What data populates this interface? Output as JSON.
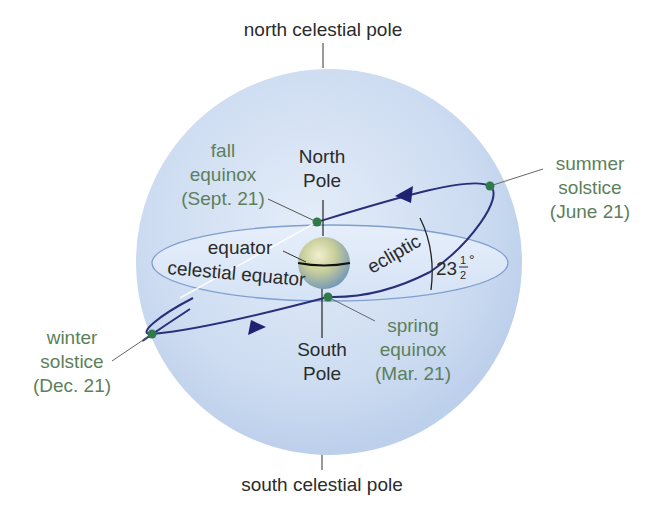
{
  "diagram": {
    "labels": {
      "north_celestial_pole": "north celestial pole",
      "south_celestial_pole": "south celestial pole",
      "north_pole_line1": "North",
      "north_pole_line2": "Pole",
      "south_pole_line1": "South",
      "south_pole_line2": "Pole",
      "equator": "equator",
      "celestial_equator": "celestial equator",
      "ecliptic": "ecliptic",
      "tilt_angle_whole": "23",
      "tilt_angle_num": "1",
      "tilt_angle_den": "2",
      "tilt_angle_unit": "°"
    },
    "events": {
      "fall_equinox": {
        "line1": "fall",
        "line2": "equinox",
        "line3": "(Sept. 21)"
      },
      "summer_solstice": {
        "line1": "summer",
        "line2": "solstice",
        "line3": "(June 21)"
      },
      "winter_solstice": {
        "line1": "winter",
        "line2": "solstice",
        "line3": "(Dec. 21)"
      },
      "spring_equinox": {
        "line1": "spring",
        "line2": "equinox",
        "line3": "(Mar. 21)"
      }
    },
    "colors": {
      "sphere": "#c9daf0",
      "equator_plane": "#dfeaf8",
      "ecliptic": "#2a2f7a",
      "event_dot": "#2f7a4a",
      "event_label": "#5c7f5c",
      "text": "#2b2b2b"
    }
  }
}
